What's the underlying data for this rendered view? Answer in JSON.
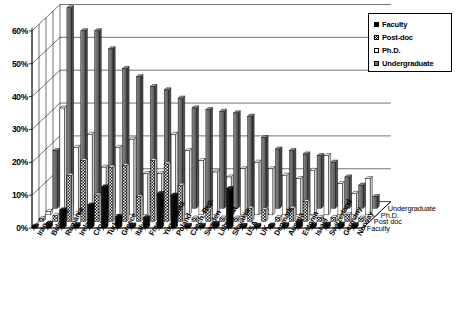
{
  "chart_data": {
    "type": "bar",
    "title": "",
    "subtitle": "",
    "xlabel": "",
    "ylabel": "",
    "zlabel": "",
    "ylim": [
      0,
      60
    ],
    "ytick_labels": [
      "0%",
      "10%",
      "20%",
      "30%",
      "40%",
      "50%",
      "60%"
    ],
    "ytick_values": [
      0,
      10,
      20,
      30,
      40,
      50,
      60
    ],
    "grid": true,
    "legend_position": "top-right",
    "projection": "3d",
    "categories": [
      "Iran",
      "Bulgaria",
      "Rumania",
      "Ireland",
      "Croatia",
      "Turkey",
      "Greece",
      "Italy",
      "France",
      "Yugoslavia",
      "Poland",
      "Czech. Rep.",
      "Sweden",
      "Lithuania",
      "Slovakia",
      "USA",
      "UK",
      "Denmark",
      "Austria",
      "Estonia",
      "Israel",
      "Switzerland",
      "Germany",
      "Norway"
    ],
    "depth_categories": [
      "Undergraduate",
      "Ph.D.",
      "Post doc",
      "Faculty"
    ],
    "series": [
      {
        "name": "Faculty",
        "fill": "solid-black",
        "color": "#000000",
        "values": [
          0.6,
          1.5,
          5.5,
          1.0,
          7.0,
          12.5,
          3.5,
          0.9,
          3.2,
          10.5,
          10.0,
          0.8,
          0.8,
          1.4,
          12.0,
          0.8,
          0.8,
          0.9,
          1.0,
          2.0,
          1.0,
          1.2,
          1.2,
          1.0
        ]
      },
      {
        "name": "Post-doc",
        "fill": "checker-hatch",
        "color": "#ffffff",
        "values": [
          0.8,
          1.8,
          14.0,
          18.5,
          8.0,
          16.5,
          17.0,
          7.5,
          18.5,
          17.5,
          11.0,
          1.0,
          3.5,
          1.0,
          1.0,
          4.0,
          3.5,
          1.2,
          4.0,
          6.0,
          1.2,
          1.2,
          2.0,
          1.0
        ]
      },
      {
        "name": "Ph.D.",
        "fill": "white",
        "color": "#ffffff",
        "values": [
          1.0,
          32.5,
          20.5,
          24.5,
          14.5,
          20.5,
          23.0,
          12.5,
          12.5,
          24.5,
          19.5,
          16.5,
          13.0,
          11.5,
          14.0,
          16.0,
          14.0,
          12.0,
          11.0,
          13.5,
          18.0,
          9.5,
          6.5,
          11.0
        ]
      },
      {
        "name": "Undergraduate",
        "fill": "gray",
        "color": "#6e6e6e",
        "values": [
          17.5,
          61.0,
          54.0,
          54.0,
          48.5,
          42.5,
          40.0,
          37.0,
          36.0,
          33.5,
          30.5,
          30.0,
          29.5,
          29.0,
          28.0,
          21.5,
          18.0,
          17.5,
          16.5,
          16.0,
          14.0,
          9.5,
          7.0,
          3.5
        ]
      }
    ]
  },
  "legend": {
    "items": [
      {
        "label": "Faculty",
        "swatch": "faculty"
      },
      {
        "label": "Post-doc",
        "swatch": "postdoc"
      },
      {
        "label": "Ph.D.",
        "swatch": "phd"
      },
      {
        "label": "Undergraduate",
        "swatch": "undergrad"
      }
    ]
  }
}
